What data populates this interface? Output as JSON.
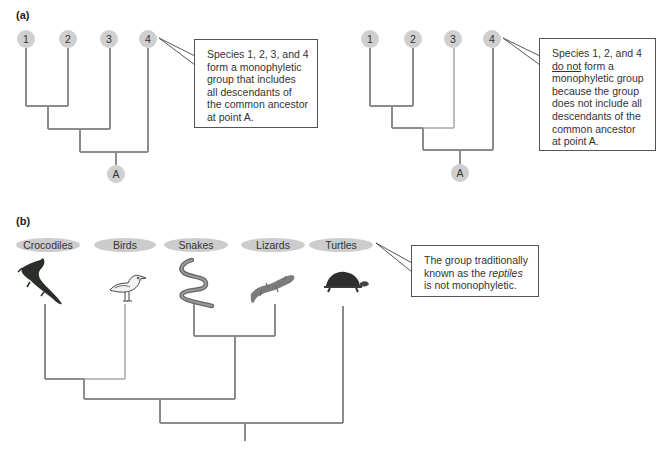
{
  "panels": {
    "a": {
      "label": "(a)",
      "tree_left": {
        "species": [
          "1",
          "2",
          "3",
          "4"
        ],
        "ancestor": "A",
        "callout": "Species 1, 2, 3, and 4 form a monophyletic group that includes all descendants of the common ancestor at point A."
      },
      "tree_right": {
        "species": [
          "1",
          "2",
          "3",
          "4"
        ],
        "ancestor": "A",
        "callout_prefix": "Species 1, 2, and 4",
        "callout_underlined": "do not",
        "callout_suffix": "form a monophyletic group because the group does not include all descendants of the common ancestor at point A."
      }
    },
    "b": {
      "label": "(b)",
      "taxa": [
        "Crocodiles",
        "Birds",
        "Snakes",
        "Lizards",
        "Turtles"
      ],
      "icons": [
        "crocodile-icon",
        "bird-icon",
        "snake-icon",
        "lizard-icon",
        "turtle-icon"
      ],
      "callout_prefix": "The group traditionally known as the",
      "callout_italic": "reptiles",
      "callout_suffix": "is not monophyletic."
    }
  },
  "colors": {
    "branch": "#8c8c8c",
    "branch_excluded": "#bdbdbd",
    "node_fill": "#cfcfcf",
    "oval_fill": "#cccccc",
    "callout_border": "#555555"
  }
}
